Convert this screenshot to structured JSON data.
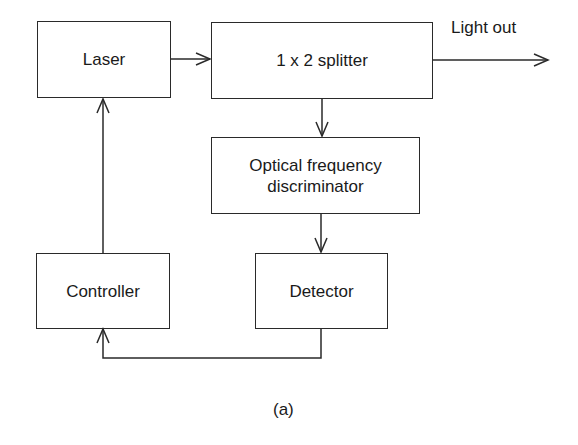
{
  "diagram": {
    "caption": "(a)",
    "blocks": {
      "laser": {
        "label": "Laser"
      },
      "splitter": {
        "label": "1 x 2 splitter"
      },
      "discriminator": {
        "label": "Optical frequency discriminator",
        "line1": "Optical frequency",
        "line2": "discriminator"
      },
      "detector": {
        "label": "Detector"
      },
      "controller": {
        "label": "Controller"
      }
    },
    "output_label": "Light out",
    "connections": [
      {
        "from": "laser",
        "to": "splitter"
      },
      {
        "from": "splitter",
        "to": "light-out"
      },
      {
        "from": "splitter",
        "to": "discriminator"
      },
      {
        "from": "discriminator",
        "to": "detector"
      },
      {
        "from": "detector",
        "to": "controller"
      },
      {
        "from": "controller",
        "to": "laser"
      }
    ],
    "colors": {
      "stroke": "#2a2a2a",
      "background": "#ffffff",
      "text": "#1a1a1a"
    }
  }
}
